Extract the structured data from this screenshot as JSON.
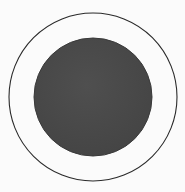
{
  "figure": {
    "background": "#fbfbfb",
    "outer_circle": {
      "cx": 93,
      "cy": 97,
      "r": 84,
      "stroke": "#2a2a2a",
      "fill": "none"
    },
    "inner_disc": {
      "cx": 93,
      "cy": 97,
      "r": 59,
      "fill": "#4b4b4b",
      "stroke": "#3a3a3a"
    }
  }
}
